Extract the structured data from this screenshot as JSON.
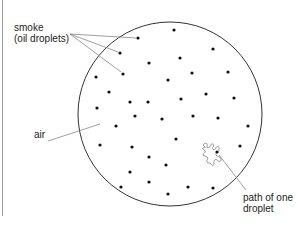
{
  "diagram": {
    "labels": {
      "smoke_line1": "smoke",
      "smoke_line2": "(oil droplets)",
      "air": "air",
      "path_line1": "path of one",
      "path_line2": "droplet"
    },
    "circle": {
      "cx": 170,
      "cy": 114,
      "r": 92,
      "stroke": "#333333"
    },
    "leader_color": "#888888",
    "dot_color": "#111111",
    "droplets": [
      [
        174,
        30
      ],
      [
        138,
        38
      ],
      [
        120,
        53
      ],
      [
        149,
        63
      ],
      [
        180,
        58
      ],
      [
        213,
        49
      ],
      [
        96,
        77
      ],
      [
        123,
        74
      ],
      [
        168,
        80
      ],
      [
        192,
        73
      ],
      [
        228,
        72
      ],
      [
        109,
        92
      ],
      [
        130,
        102
      ],
      [
        148,
        102
      ],
      [
        181,
        99
      ],
      [
        206,
        94
      ],
      [
        234,
        98
      ],
      [
        97,
        108
      ],
      [
        135,
        116
      ],
      [
        162,
        119
      ],
      [
        193,
        116
      ],
      [
        218,
        118
      ],
      [
        116,
        126
      ],
      [
        248,
        126
      ],
      [
        176,
        139
      ],
      [
        240,
        146
      ],
      [
        100,
        145
      ],
      [
        132,
        147
      ],
      [
        149,
        157
      ],
      [
        166,
        165
      ],
      [
        130,
        172
      ],
      [
        121,
        187
      ],
      [
        149,
        182
      ],
      [
        168,
        194
      ],
      [
        188,
        187
      ],
      [
        213,
        188
      ]
    ],
    "highlighted_droplet": [
      217,
      152
    ]
  }
}
